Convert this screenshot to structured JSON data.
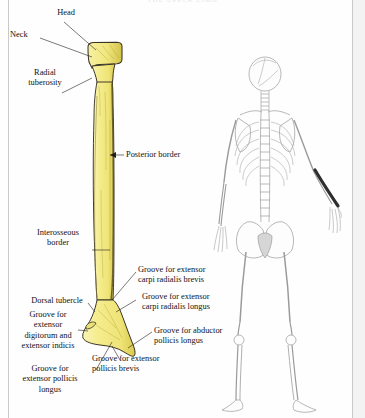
{
  "page": {
    "running_head": "THE UPPER LIMB",
    "background_color": "#fefefe",
    "rule_color": "#c9c9c9"
  },
  "figure": {
    "bone_name": "radius",
    "view": "posterior view of the right radius",
    "bone_fill_color": "#f3ea86",
    "bone_outline_color": "#3a3425",
    "bone_shadow_color": "#d9cc5a"
  },
  "labels": [
    {
      "id": "head",
      "text": "Head",
      "align": "center"
    },
    {
      "id": "neck",
      "text": "Neck",
      "align": "left"
    },
    {
      "id": "radial-tuberosity",
      "text": "Radial\ntuberosity",
      "align": "center"
    },
    {
      "id": "posterior-border",
      "text": "Posterior border",
      "align": "left"
    },
    {
      "id": "interosseous-border",
      "text": "Interosseous\nborder",
      "align": "center"
    },
    {
      "id": "dorsal-tubercle",
      "text": "Dorsal tubercle",
      "align": "center"
    },
    {
      "id": "ext-dig-indicis",
      "text": "Groove for\nextensor\ndigitorum and\nextensor indicis",
      "align": "center"
    },
    {
      "id": "ext-poll-longus",
      "text": "Groove for\nextensor pollicis\nlongus",
      "align": "center"
    },
    {
      "id": "ecr-brevis",
      "text": "Groove for extensor\ncarpi radialis brevis",
      "align": "left"
    },
    {
      "id": "ecr-longus",
      "text": "Groove for extensor\ncarpi radialis longus",
      "align": "left"
    },
    {
      "id": "abd-poll-longus",
      "text": "Groove for abductor\npollicis longus",
      "align": "left"
    },
    {
      "id": "ext-poll-brevis",
      "text": "Groove for extensor\npollicis brevis",
      "align": "left"
    }
  ],
  "skeleton": {
    "description": "posterior view of full human skeleton locator figure",
    "highlight": "right radius shaded dark",
    "highlight_color": "#2e2e2e",
    "outline_color": "#9a9a9a"
  }
}
